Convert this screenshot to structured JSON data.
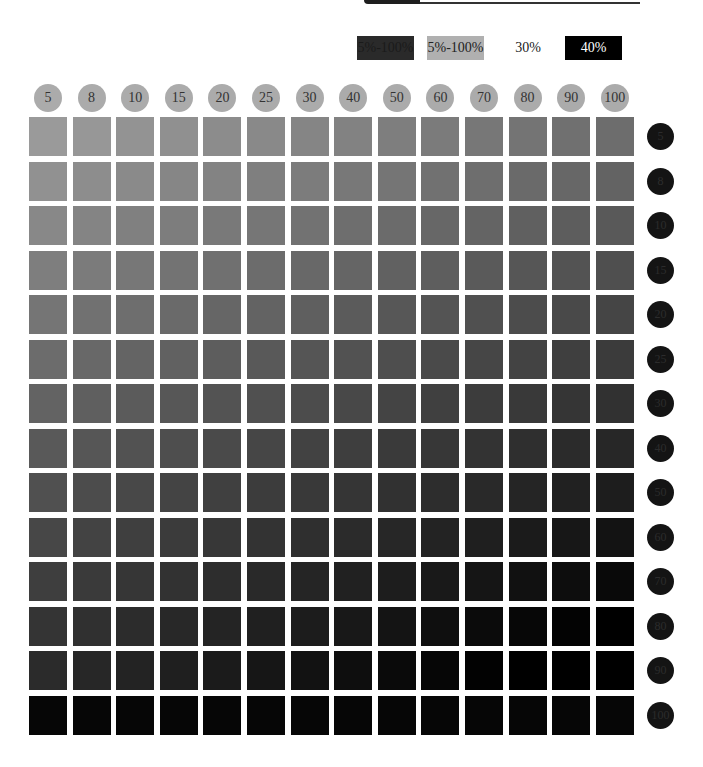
{
  "header": {
    "legend": [
      {
        "label": "5%-100%",
        "bg": "#2a2a2a",
        "fg": "#1a1a1a"
      },
      {
        "label": "5%-100%",
        "bg": "#b0b0b0",
        "fg": "#222222"
      },
      {
        "label": "30%",
        "bg": "#ffffff",
        "fg": "#222222"
      },
      {
        "label": "40%",
        "bg": "#000000",
        "fg": "#ffffff"
      }
    ]
  },
  "columns": [
    "5",
    "8",
    "10",
    "15",
    "20",
    "25",
    "30",
    "40",
    "50",
    "60",
    "70",
    "80",
    "90",
    "100"
  ],
  "rows": [
    "5",
    "8",
    "10",
    "15",
    "20",
    "25",
    "30",
    "40",
    "50",
    "60",
    "70",
    "80",
    "90",
    "100"
  ],
  "colors": {
    "column_header_circle": "#ababab",
    "row_header_circle": "#141414",
    "top_left_cell": "#9a9a9a",
    "bottom_right_cell": "#000000"
  }
}
